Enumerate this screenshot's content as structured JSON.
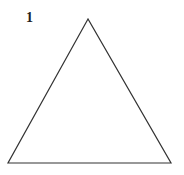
{
  "figure": {
    "label": "1",
    "shape": "triangle",
    "vertices": [
      [
        88,
        19
      ],
      [
        8,
        163
      ],
      [
        171,
        163
      ]
    ],
    "stroke_color": "#333333",
    "fill_color": "#ffffff"
  }
}
